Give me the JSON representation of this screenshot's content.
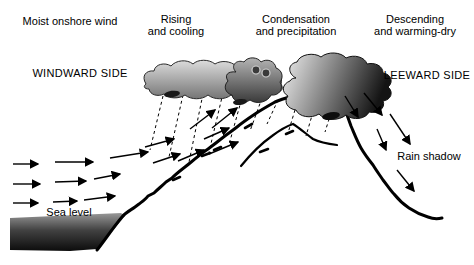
{
  "diagram": {
    "type": "orographic-precipitation-rain-shadow-diagram",
    "labels": {
      "moist_onshore_wind": "Moist onshore wind",
      "rising_line1": "Rising",
      "rising_line2": "and cooling",
      "condensation_line1": "Condensation",
      "condensation_line2": "and precipitation",
      "descending_line1": "Descending",
      "descending_line2": "and warming-dry",
      "windward_side": "WINDWARD SIDE",
      "leeward_side": "LEEWARD SIDE",
      "sea_level": "Sea level",
      "rain_shadow": "Rain shadow"
    },
    "icons": {
      "wind_arrows": "arrow-right",
      "upslope_arrows": "arrow-up-right",
      "downslope_arrows": "arrow-down-right",
      "rain": "dashed-rain-lines",
      "clouds": "cumulus-cloud-shapes"
    },
    "colors": {
      "background": "#ffffff",
      "ink": "#000000",
      "cloud_windward_top": "#dcdcdc",
      "cloud_windward_bottom": "#757575",
      "cloud_mid_top": "#b4b4b4",
      "cloud_mid_bottom": "#3a3a3a",
      "cloud_peak_left": "#f0f0f0",
      "cloud_peak_right": "#141414",
      "sea_top": "#989898",
      "sea_mid": "#424242",
      "sea_bottom": "#0c0c0c"
    }
  }
}
